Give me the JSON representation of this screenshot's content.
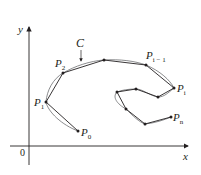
{
  "diagram": {
    "axes": {
      "x_label": "x",
      "y_label": "y",
      "origin_label": "0"
    },
    "curve_label": "C",
    "points": [
      {
        "name": "P0",
        "label": "P",
        "sub": "0",
        "x": 78,
        "y": 131
      },
      {
        "name": "P1",
        "label": "P",
        "sub": "1",
        "x": 46,
        "y": 102
      },
      {
        "name": "P2",
        "label": "P",
        "sub": "2",
        "x": 63,
        "y": 73
      },
      {
        "name": "p3",
        "label": "",
        "sub": "",
        "x": 104,
        "y": 60
      },
      {
        "name": "Pi-1",
        "label": "P",
        "sub": "i − 1",
        "x": 146,
        "y": 65
      },
      {
        "name": "Pi",
        "label": "P",
        "sub": "i",
        "x": 174,
        "y": 88
      },
      {
        "name": "p6",
        "label": "",
        "sub": "",
        "x": 158,
        "y": 97
      },
      {
        "name": "p7",
        "label": "",
        "sub": "",
        "x": 136,
        "y": 89
      },
      {
        "name": "p8",
        "label": "",
        "sub": "",
        "x": 117,
        "y": 92
      },
      {
        "name": "p9",
        "label": "",
        "sub": "",
        "x": 126,
        "y": 109
      },
      {
        "name": "p10",
        "label": "",
        "sub": "",
        "x": 145,
        "y": 124
      },
      {
        "name": "Pn",
        "label": "P",
        "sub": "n",
        "x": 171,
        "y": 117
      }
    ],
    "colors": {
      "ink": "#231f20",
      "curve": "#6d6e71",
      "polygon": "#231f20"
    }
  }
}
